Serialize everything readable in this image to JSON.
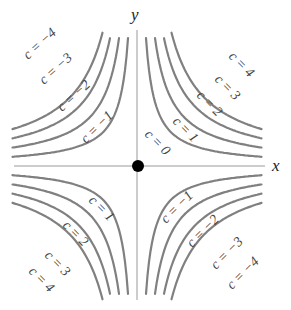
{
  "diagram": {
    "axes": {
      "x_label": "x",
      "y_label": "y"
    },
    "origin_point": {
      "label": "",
      "color": "#000000"
    },
    "curve_color": "#808080",
    "labels": {
      "tl": [
        "c = −4",
        "c = −3",
        "c = −2",
        "c = −1"
      ],
      "tr": [
        "c = 4",
        "c = 3",
        "c = 2",
        "c = 1"
      ],
      "bl": [
        "c = 1",
        "c = 2",
        "c = 3",
        "c = 4"
      ],
      "br": [
        "c = −1",
        "c = −2",
        "c = −3",
        "c = −4"
      ],
      "center": "c = 0"
    }
  }
}
